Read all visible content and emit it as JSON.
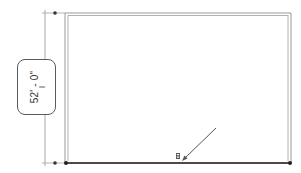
{
  "drawing": {
    "dimension": {
      "value": "52' - 0\"",
      "orientation": "vertical",
      "cursor_glyph": "I"
    },
    "selected_element": "bottom-wall",
    "icons": {
      "flip_control": "flip-arrows-icon",
      "pointer": "arrow-pointer-icon"
    },
    "colors": {
      "wall_line": "#9a9a9a",
      "selected_wall": "#4a4a4a",
      "dimension_line": "#aaaaaa",
      "grip": "#333333",
      "label_border": "#5a5a5a"
    }
  }
}
